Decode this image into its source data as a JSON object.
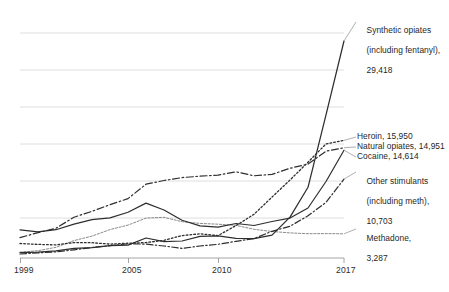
{
  "chart_data": {
    "type": "line",
    "title": "",
    "subtitle": "",
    "xlabel": "",
    "ylabel": "",
    "grid": true,
    "legend_position": "right-inline-labels",
    "xlim": [
      1999,
      2017
    ],
    "ylim": [
      0,
      32000
    ],
    "xticks": [
      "1999",
      "2005",
      "2010",
      "2017"
    ],
    "xtick_values": [
      1999,
      2005,
      2010,
      2017
    ],
    "yticks": [],
    "x": [
      1999,
      2000,
      2001,
      2002,
      2003,
      2004,
      2005,
      2006,
      2007,
      2008,
      2009,
      2010,
      2011,
      2012,
      2013,
      2014,
      2015,
      2016,
      2017
    ],
    "series": [
      {
        "name": "Synthetic opiates (including fentanyl)",
        "label_lines": [
          "Synthetic opiates",
          "(including fentanyl),",
          "29,418"
        ],
        "end_value": 29418,
        "end_value_text": "29,418",
        "line_style": "solid",
        "color": "#2e2e2e",
        "values": [
          730,
          782,
          957,
          1295,
          1400,
          1664,
          1742,
          2707,
          2213,
          2306,
          2946,
          3007,
          2666,
          2628,
          3105,
          5544,
          9580,
          19413,
          29418
        ]
      },
      {
        "name": "Heroin",
        "label_lines": [
          "Heroin, 15,950"
        ],
        "end_value": 15950,
        "end_value_text": "15,950",
        "line_style": "dotted",
        "color": "#2e2e2e",
        "values": [
          1960,
          1842,
          1779,
          2089,
          2080,
          1878,
          2009,
          2088,
          2399,
          3041,
          3278,
          3036,
          4397,
          5925,
          8257,
          10574,
          12989,
          15469,
          15950
        ]
      },
      {
        "name": "Natural opiates",
        "label_lines": [
          "Natural opiates, 14,951"
        ],
        "end_value": 14951,
        "end_value_text": "14,951",
        "line_style": "dash-dot",
        "color": "#2e2e2e",
        "values": [
          2749,
          3442,
          4042,
          5528,
          6338,
          7232,
          8048,
          10002,
          10505,
          10897,
          11094,
          11240,
          11693,
          11140,
          11341,
          12159,
          12727,
          14487,
          14951
        ]
      },
      {
        "name": "Cocaine",
        "label_lines": [
          "Cocaine, 14,614"
        ],
        "end_value": 14614,
        "end_value_text": "14,614",
        "line_style": "solid",
        "color": "#2e2e2e",
        "values": [
          3822,
          3544,
          3833,
          4599,
          5196,
          5443,
          6208,
          7448,
          6512,
          5129,
          4350,
          4183,
          4681,
          4404,
          4944,
          5415,
          6784,
          10375,
          14614
        ]
      },
      {
        "name": "Other stimulants (including meth)",
        "label_lines": [
          "Other stimulants",
          "(including meth),",
          "10,703"
        ],
        "end_value": 10703,
        "end_value_text": "10,703",
        "line_style": "dash-dot",
        "color": "#2e2e2e",
        "values": [
          547,
          691,
          845,
          1117,
          1421,
          1664,
          1920,
          1883,
          1622,
          1304,
          1632,
          1854,
          2266,
          2635,
          3627,
          4298,
          5716,
          7542,
          10703
        ]
      },
      {
        "name": "Methadone",
        "label_lines": [
          "Methadone,",
          "3,287"
        ],
        "end_value": 3287,
        "end_value_text": "3,287",
        "line_style": "fine-dotted",
        "color": "#8a8a8a",
        "values": [
          784,
          988,
          1456,
          2360,
          2972,
          3849,
          4460,
          5406,
          5518,
          4924,
          4694,
          4577,
          4418,
          3889,
          3591,
          3400,
          3301,
          3314,
          3287
        ]
      }
    ]
  },
  "axis": {
    "xtick_1999": "1999",
    "xtick_2005": "2005",
    "xtick_2010": "2010",
    "xtick_2017": "2017"
  },
  "labels": {
    "synthetic_l1": "Synthetic opiates",
    "synthetic_l2": "(including fentanyl),",
    "synthetic_l3": "29,418",
    "heroin": "Heroin, 15,950",
    "natural": "Natural opiates, 14,951",
    "cocaine": "Cocaine, 14,614",
    "stimulants_l1": "Other stimulants",
    "stimulants_l2": "(including meth),",
    "stimulants_l3": "10,703",
    "methadone_l1": "Methadone,",
    "methadone_l2": "3,287"
  },
  "colors": {
    "gridline": "#d6d6d6",
    "axis": "#9a9a9a",
    "line_dark": "#2e2e2e",
    "line_light": "#8a8a8a",
    "text": "#1f1f1f",
    "background": "#ffffff"
  }
}
